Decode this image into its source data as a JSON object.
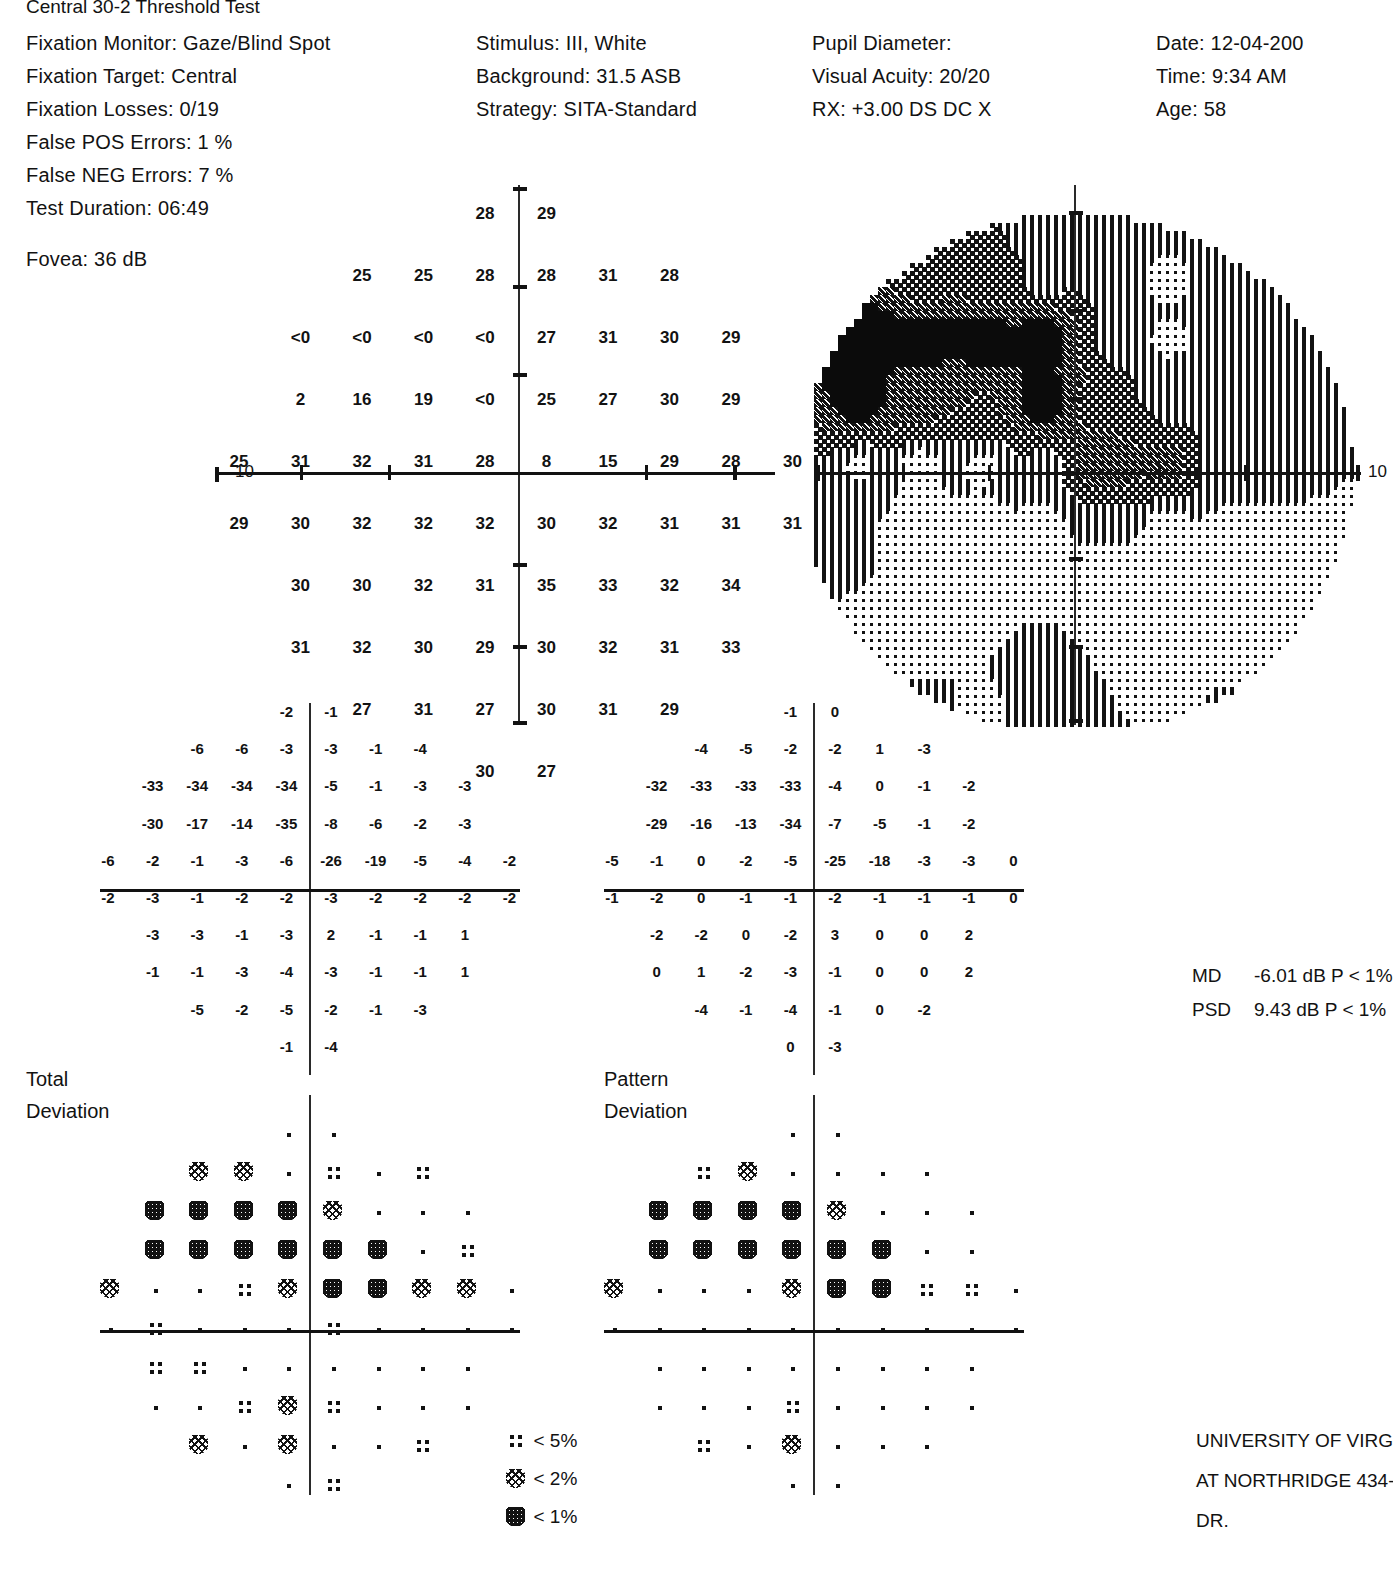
{
  "report": {
    "title": "Central 30-2 Threshold Test"
  },
  "reliability": {
    "fixation_monitor": "Fixation Monitor: Gaze/Blind Spot",
    "fixation_target": "Fixation Target: Central",
    "fixation_losses": "Fixation Losses: 0/19",
    "false_pos": "False POS Errors:  1 %",
    "false_neg": "False NEG Errors:  7 %",
    "test_duration": "Test Duration: 06:49",
    "fovea": "Fovea: 36 dB"
  },
  "test_params": {
    "stimulus": "Stimulus: III, White",
    "background": "Background: 31.5 ASB",
    "strategy": "Strategy: SITA-Standard"
  },
  "patient_optics": {
    "pupil_diameter": "Pupil Diameter:",
    "visual_acuity": "Visual Acuity: 20/20",
    "rx": "RX: +3.00 DS        DC  X"
  },
  "visit": {
    "date": "Date: 12-04-200",
    "time": "Time:  9:34 AM",
    "age": "Age: 58"
  },
  "axis_labels": {
    "threshold_left": "10",
    "grayscale_right": "10"
  },
  "section_labels": {
    "total_deviation_line1": "Total",
    "total_deviation_line2": "Deviation",
    "pattern_deviation_line1": "Pattern",
    "pattern_deviation_line2": "Deviation"
  },
  "indices": {
    "md_label": "MD",
    "md_value": "-6.01 dB  P < 1%",
    "psd_label": "PSD",
    "psd_value": "9.43 dB  P < 1%"
  },
  "legend": [
    {
      "level": 1,
      "label": "< 5%"
    },
    {
      "level": 2,
      "label": "< 2%"
    },
    {
      "level": 3,
      "label": "< 1%"
    }
  ],
  "footer": {
    "line1": "UNIVERSITY OF VIRGINIA EY",
    "line2": "AT NORTHRIDGE 434-243-4",
    "line3": "DR."
  },
  "chart_data": {
    "type": "table",
    "xlabel": "Horizontal eccentricity (degrees)",
    "ylabel": "Vertical eccentricity (degrees)",
    "units": "dB",
    "grid_columns": 10,
    "grid_rows": 8,
    "threshold_sensitivity": {
      "description": "Measured retinal sensitivity in decibels at each 30-2 test location. Blank = location not tested. '<0' = stimulus not seen at maximum intensity.",
      "rows": [
        [
          null,
          null,
          null,
          null,
          "28",
          "29",
          null,
          null,
          null,
          null
        ],
        [
          null,
          null,
          "25",
          "25",
          "28",
          "28",
          "31",
          "28",
          null,
          null
        ],
        [
          null,
          "<0",
          "<0",
          "<0",
          "<0",
          "27",
          "31",
          "30",
          "29",
          null
        ],
        [
          null,
          "2",
          "16",
          "19",
          "<0",
          "25",
          "27",
          "30",
          "29",
          null
        ],
        [
          "25",
          "31",
          "32",
          "31",
          "28",
          "8",
          "15",
          "29",
          "28",
          "30"
        ],
        [
          "29",
          "30",
          "32",
          "32",
          "32",
          "30",
          "32",
          "31",
          "31",
          "31"
        ],
        [
          null,
          "30",
          "30",
          "32",
          "31",
          "35",
          "33",
          "32",
          "34",
          null
        ],
        [
          null,
          "31",
          "32",
          "30",
          "29",
          "30",
          "32",
          "31",
          "33",
          null
        ],
        [
          null,
          null,
          "27",
          "31",
          "27",
          "30",
          "31",
          "29",
          null,
          null
        ],
        [
          null,
          null,
          null,
          null,
          "30",
          "27",
          null,
          null,
          null,
          null
        ]
      ]
    },
    "total_deviation_values": {
      "description": "Total deviation from age-matched normal values, dB.",
      "rows": [
        [
          null,
          null,
          null,
          null,
          "-2",
          "-1",
          null,
          null,
          null,
          null
        ],
        [
          null,
          null,
          "-6",
          "-6",
          "-3",
          "-3",
          "-1",
          "-4",
          null,
          null
        ],
        [
          null,
          "-33",
          "-34",
          "-34",
          "-34",
          "-5",
          "-1",
          "-3",
          "-3",
          null
        ],
        [
          null,
          "-30",
          "-17",
          "-14",
          "-35",
          "-8",
          "-6",
          "-2",
          "-3",
          null
        ],
        [
          "-6",
          "-2",
          "-1",
          "-3",
          "-6",
          "-26",
          "-19",
          "-5",
          "-4",
          "-2"
        ],
        [
          "-2",
          "-3",
          "-1",
          "-2",
          "-2",
          "-3",
          "-2",
          "-2",
          "-2",
          "-2"
        ],
        [
          null,
          "-3",
          "-3",
          "-1",
          "-3",
          "2",
          "-1",
          "-1",
          "1",
          null
        ],
        [
          null,
          "-1",
          "-1",
          "-3",
          "-4",
          "-3",
          "-1",
          "-1",
          "1",
          null
        ],
        [
          null,
          null,
          "-5",
          "-2",
          "-5",
          "-2",
          "-1",
          "-3",
          null,
          null
        ],
        [
          null,
          null,
          null,
          null,
          "-1",
          "-4",
          null,
          null,
          null,
          null
        ]
      ]
    },
    "pattern_deviation_values": {
      "description": "Pattern deviation (total deviation corrected for general height), dB.",
      "rows": [
        [
          null,
          null,
          null,
          null,
          "-1",
          "0",
          null,
          null,
          null,
          null
        ],
        [
          null,
          null,
          "-4",
          "-5",
          "-2",
          "-2",
          "1",
          "-3",
          null,
          null
        ],
        [
          null,
          "-32",
          "-33",
          "-33",
          "-33",
          "-4",
          "0",
          "-1",
          "-2",
          null
        ],
        [
          null,
          "-29",
          "-16",
          "-13",
          "-34",
          "-7",
          "-5",
          "-1",
          "-2",
          null
        ],
        [
          "-5",
          "-1",
          "0",
          "-2",
          "-5",
          "-25",
          "-18",
          "-3",
          "-3",
          "0"
        ],
        [
          "-1",
          "-2",
          "0",
          "-1",
          "-1",
          "-2",
          "-1",
          "-1",
          "-1",
          "0"
        ],
        [
          null,
          "-2",
          "-2",
          "0",
          "-2",
          "3",
          "0",
          "0",
          "2",
          null
        ],
        [
          null,
          "0",
          "1",
          "-2",
          "-3",
          "-1",
          "0",
          "0",
          "2",
          null
        ],
        [
          null,
          null,
          "-4",
          "-1",
          "-4",
          "-1",
          "0",
          "-2",
          null,
          null
        ],
        [
          null,
          null,
          null,
          null,
          "0",
          "-3",
          null,
          null,
          null,
          null
        ]
      ]
    },
    "total_deviation_symbols": {
      "description": "Probability symbol levels. 0 = within normal limits (single dot), 1 = p<5%, 2 = p<2%, 3 = p<1%.",
      "rows": [
        [
          null,
          null,
          null,
          null,
          0,
          0,
          null,
          null,
          null,
          null
        ],
        [
          null,
          null,
          2,
          2,
          0,
          1,
          0,
          1,
          null,
          null
        ],
        [
          null,
          3,
          3,
          3,
          3,
          2,
          0,
          0,
          0,
          null
        ],
        [
          null,
          3,
          3,
          3,
          3,
          3,
          3,
          0,
          1,
          null
        ],
        [
          2,
          0,
          0,
          1,
          2,
          3,
          3,
          2,
          2,
          0
        ],
        [
          0,
          1,
          0,
          0,
          0,
          1,
          0,
          0,
          0,
          0
        ],
        [
          null,
          1,
          1,
          0,
          0,
          0,
          0,
          0,
          0,
          null
        ],
        [
          null,
          0,
          0,
          1,
          2,
          1,
          0,
          0,
          0,
          null
        ],
        [
          null,
          null,
          2,
          0,
          2,
          0,
          0,
          1,
          null,
          null
        ],
        [
          null,
          null,
          null,
          null,
          0,
          1,
          null,
          null,
          null,
          null
        ]
      ]
    },
    "pattern_deviation_symbols": {
      "description": "Probability symbol levels. 0 = within normal limits (single dot), 1 = p<5%, 2 = p<2%, 3 = p<1%.",
      "rows": [
        [
          null,
          null,
          null,
          null,
          0,
          0,
          null,
          null,
          null,
          null
        ],
        [
          null,
          null,
          1,
          2,
          0,
          0,
          0,
          0,
          null,
          null
        ],
        [
          null,
          3,
          3,
          3,
          3,
          2,
          0,
          0,
          0,
          null
        ],
        [
          null,
          3,
          3,
          3,
          3,
          3,
          3,
          0,
          0,
          null
        ],
        [
          2,
          0,
          0,
          0,
          2,
          3,
          3,
          1,
          1,
          0
        ],
        [
          0,
          0,
          0,
          0,
          0,
          0,
          0,
          0,
          0,
          0
        ],
        [
          null,
          0,
          0,
          0,
          0,
          0,
          0,
          0,
          0,
          null
        ],
        [
          null,
          0,
          0,
          0,
          1,
          0,
          0,
          0,
          0,
          null
        ],
        [
          null,
          null,
          1,
          0,
          2,
          0,
          0,
          0,
          null,
          null
        ],
        [
          null,
          null,
          null,
          null,
          0,
          0,
          null,
          null,
          null,
          null
        ]
      ]
    },
    "grayscale_map": {
      "description": "Halftone grayscale representation of the threshold field. Darkness encodes sensitivity loss; dense black region = absolute scotoma in the superior nasal field, mid-gray blob = blind spot / paracentral depression.",
      "shading_levels": [
        "white",
        "light-stipple",
        "mid-stipple",
        "dark-stipple",
        "solid-black"
      ]
    }
  }
}
